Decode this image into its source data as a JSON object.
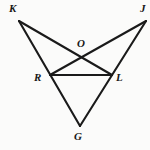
{
  "figure": {
    "kind": "geometry-diagram",
    "background_color": "#fbfbfa",
    "line_color": "#1a1a1a",
    "line_width": 2.1,
    "label_color": "#171717",
    "canvas": {
      "width": 150,
      "height": 150
    },
    "points": [
      {
        "id": "K",
        "label": "K",
        "x": 19,
        "y": 21,
        "label_x": 9,
        "label_y": 3
      },
      {
        "id": "J",
        "label": "J",
        "x": 146,
        "y": 21,
        "label_x": 140,
        "label_y": 3
      },
      {
        "id": "O",
        "label": "O",
        "x": 82,
        "y": 58,
        "label_x": 77,
        "label_y": 38
      },
      {
        "id": "R",
        "label": "R",
        "x": 50,
        "y": 75,
        "label_x": 34,
        "label_y": 72
      },
      {
        "id": "L",
        "label": "L",
        "x": 112,
        "y": 75,
        "label_x": 116,
        "label_y": 72
      },
      {
        "id": "G",
        "label": "G",
        "x": 80,
        "y": 126,
        "label_x": 74,
        "label_y": 131
      }
    ],
    "segments": [
      {
        "id": "KL",
        "name": "segment-k-l",
        "from": "K",
        "to": "L",
        "x1": 19,
        "y1": 21,
        "x2": 112,
        "y2": 75
      },
      {
        "id": "JR",
        "name": "segment-j-r",
        "from": "J",
        "to": "R",
        "x1": 146,
        "y1": 21,
        "x2": 50,
        "y2": 75
      },
      {
        "id": "KG",
        "name": "segment-k-g",
        "from": "K",
        "to": "G",
        "x1": 19,
        "y1": 21,
        "x2": 80,
        "y2": 126
      },
      {
        "id": "JG",
        "name": "segment-j-g",
        "from": "J",
        "to": "G",
        "x1": 146,
        "y1": 21,
        "x2": 80,
        "y2": 126
      },
      {
        "id": "RL",
        "name": "segment-r-l",
        "from": "R",
        "to": "L",
        "x1": 50,
        "y1": 75,
        "x2": 112,
        "y2": 75
      }
    ]
  }
}
